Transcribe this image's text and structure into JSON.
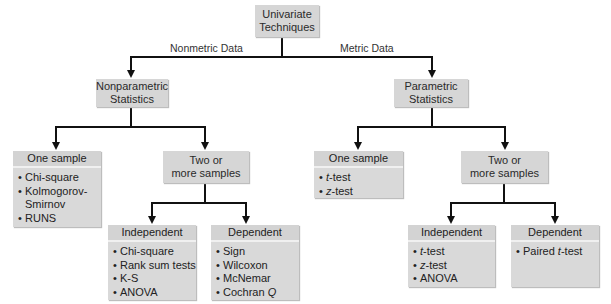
{
  "root": {
    "line1": "Univariate",
    "line2": "Techniques"
  },
  "edges": {
    "left_label": "Nonmetric Data",
    "right_label": "Metric Data"
  },
  "nonparametric": {
    "title": {
      "line1": "Nonparametric",
      "line2": "Statistics"
    },
    "one_sample": {
      "header": "One sample",
      "items": [
        "Chi-square",
        "Kolmogorov-",
        "Smirnov",
        "RUNS"
      ]
    },
    "two_or_more": {
      "line1": "Two or",
      "line2": "more samples"
    },
    "independent": {
      "header": "Independent",
      "items": [
        "Chi-square",
        "Rank sum tests",
        "K-S",
        "ANOVA"
      ]
    },
    "dependent": {
      "header": "Dependent",
      "items": [
        "Sign",
        "Wilcoxon",
        "McNemar",
        "Cochran ",
        "Q"
      ]
    }
  },
  "parametric": {
    "title": {
      "line1": "Parametric",
      "line2": "Statistics"
    },
    "one_sample": {
      "header": "One sample",
      "items": [
        {
          "italic": "t",
          "rest": "-test"
        },
        {
          "italic": "z",
          "rest": "-test"
        }
      ]
    },
    "two_or_more": {
      "line1": "Two or",
      "line2": "more samples"
    },
    "independent": {
      "header": "Independent",
      "items": [
        {
          "italic": "t",
          "rest": "-test"
        },
        {
          "italic": "z",
          "rest": "-test"
        },
        {
          "italic": "",
          "rest": "ANOVA"
        }
      ]
    },
    "dependent": {
      "header": "Dependent",
      "items": [
        {
          "pre": "Paired ",
          "italic": "t",
          "rest": "-test"
        }
      ]
    }
  },
  "bullet": "•",
  "colors": {
    "box_fill": "#d6d6d6",
    "line": "#111111",
    "background": "#ffffff"
  }
}
